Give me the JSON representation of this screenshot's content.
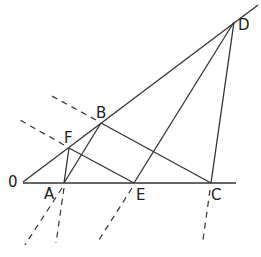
{
  "diagram": {
    "type": "geometric-construction",
    "colors": {
      "stroke": "#333333",
      "background": "#ffffff"
    },
    "points": {
      "O": {
        "label": "0",
        "x": 23,
        "y": 182
      },
      "A": {
        "label": "A",
        "x": 64,
        "y": 183
      },
      "F": {
        "label": "F",
        "x": 69,
        "y": 148
      },
      "B": {
        "label": "B",
        "x": 101,
        "y": 123
      },
      "E": {
        "label": "E",
        "x": 134,
        "y": 183
      },
      "C": {
        "label": "C",
        "x": 211,
        "y": 183
      },
      "D": {
        "label": "D",
        "x": 234,
        "y": 22
      }
    },
    "solid_segments": [
      [
        "O",
        "D-ext"
      ],
      [
        "O",
        "C-ext"
      ],
      [
        "A",
        "F"
      ],
      [
        "A",
        "B"
      ],
      [
        "F",
        "E"
      ],
      [
        "B",
        "C"
      ],
      [
        "E",
        "D"
      ],
      [
        "C",
        "D"
      ]
    ],
    "dashed_segments": [
      "A-down-left",
      "A-down",
      "E-down-left",
      "C-down",
      "B-up-left",
      "F-up-left"
    ]
  },
  "labels": {
    "O": "0",
    "A": "A",
    "F": "F",
    "B": "B",
    "E": "E",
    "C": "C",
    "D": "D"
  }
}
